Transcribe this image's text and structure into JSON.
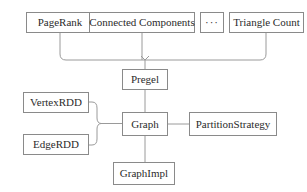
{
  "diagram": {
    "stroke_color": "#9a9a9a",
    "box_border_color": "#8a8a8a",
    "text_color": "#2b2b2b",
    "background_color": "#ffffff",
    "nodes": {
      "pagerank": {
        "label": "PageRank",
        "x": 26,
        "y": 12,
        "w": 68,
        "h": 21,
        "font_size": 11
      },
      "connected_components": {
        "label": "Connected Components",
        "x": 89,
        "y": 12,
        "w": 106,
        "h": 21,
        "font_size": 11
      },
      "ellipsis": {
        "label": "···",
        "x": 200,
        "y": 12,
        "w": 24,
        "h": 21,
        "font_size": 11
      },
      "triangle_count": {
        "label": "Triangle Count",
        "x": 229,
        "y": 12,
        "w": 75,
        "h": 21,
        "font_size": 11
      },
      "pregel": {
        "label": "Pregel",
        "x": 122,
        "y": 69,
        "w": 46,
        "h": 21,
        "font_size": 11
      },
      "vertexrdd": {
        "label": "VertexRDD",
        "x": 23,
        "y": 92,
        "w": 66,
        "h": 21,
        "font_size": 11
      },
      "edgerdd": {
        "label": "EdgeRDD",
        "x": 23,
        "y": 134,
        "w": 66,
        "h": 21,
        "font_size": 11
      },
      "graph": {
        "label": "Graph",
        "x": 122,
        "y": 112,
        "w": 46,
        "h": 24,
        "font_size": 11
      },
      "partitionstrategy": {
        "label": "PartitionStrategy",
        "x": 189,
        "y": 112,
        "w": 88,
        "h": 24,
        "font_size": 11
      },
      "graphimpl": {
        "label": "GraphImpl",
        "x": 113,
        "y": 162,
        "w": 62,
        "h": 23,
        "font_size": 11
      }
    },
    "edges": [
      {
        "name": "pagerank-to-bus",
        "from": "pagerank",
        "to": "pregel-bus"
      },
      {
        "name": "connected-components-to-bus",
        "from": "connected_components",
        "to": "pregel-bus"
      },
      {
        "name": "triangle-count-to-bus",
        "from": "triangle_count",
        "to": "pregel-bus"
      },
      {
        "name": "bus-to-pregel",
        "from": "pregel-bus",
        "to": "pregel"
      },
      {
        "name": "pregel-to-graph",
        "from": "pregel",
        "to": "graph"
      },
      {
        "name": "vertexrdd-to-brace",
        "from": "vertexrdd",
        "to": "rdd-brace"
      },
      {
        "name": "edgerdd-to-brace",
        "from": "edgerdd",
        "to": "rdd-brace"
      },
      {
        "name": "brace-to-graph",
        "from": "rdd-brace",
        "to": "graph"
      },
      {
        "name": "graph-to-partitionstrategy",
        "from": "graph",
        "to": "partitionstrategy"
      },
      {
        "name": "graph-to-graphimpl",
        "from": "graph",
        "to": "graphimpl"
      }
    ]
  }
}
